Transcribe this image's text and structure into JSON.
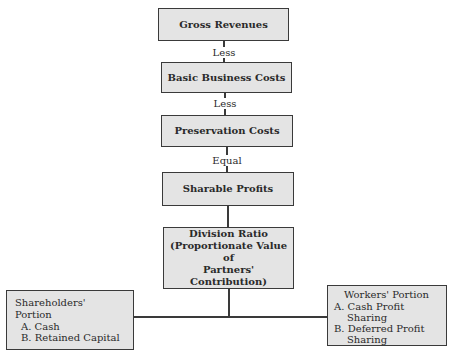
{
  "diagram": {
    "type": "flowchart",
    "nodes": [
      {
        "id": "gross",
        "label": "Gross Revenues"
      },
      {
        "id": "basic",
        "label": "Basic Business Costs"
      },
      {
        "id": "preservation",
        "label": "Preservation Costs"
      },
      {
        "id": "sharable",
        "label": "Sharable Profits"
      },
      {
        "id": "division",
        "lines": [
          "Division Ratio",
          "(Proportionate Value of",
          "Partners' Contribution)"
        ]
      },
      {
        "id": "shareholders",
        "title": "Shareholders' Portion",
        "items": [
          "A. Cash",
          "B. Retained Capital"
        ]
      },
      {
        "id": "workers",
        "title": "Workers' Portion",
        "items": [
          "A. Cash Profit",
          "Sharing",
          "B. Deferred Profit",
          "Sharing"
        ]
      }
    ],
    "edges": [
      {
        "from": "gross",
        "to": "basic",
        "label": "Less"
      },
      {
        "from": "basic",
        "to": "preservation",
        "label": "Less"
      },
      {
        "from": "preservation",
        "to": "sharable",
        "label": "Equal"
      },
      {
        "from": "sharable",
        "to": "division",
        "label": ""
      },
      {
        "from": "division",
        "to": "shareholders",
        "label": ""
      },
      {
        "from": "division",
        "to": "workers",
        "label": ""
      }
    ]
  }
}
